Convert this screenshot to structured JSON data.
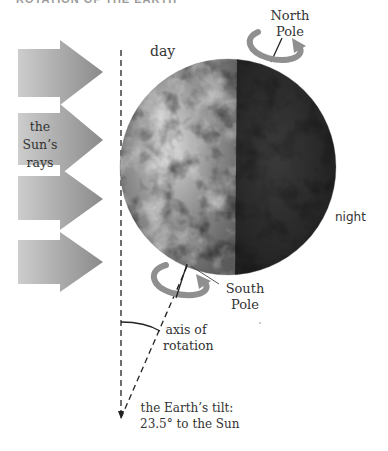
{
  "header": {
    "title": "ROTATION OF THE EARTH"
  },
  "labels": {
    "day": "day",
    "night": "night",
    "north_pole_line1": "North",
    "north_pole_line2": "Pole",
    "south_pole_line1": "South",
    "south_pole_line2": "Pole",
    "sun_rays_line1": "the Sun’s",
    "sun_rays_line2": "rays",
    "axis_line1": "axis of",
    "axis_line2": "rotation",
    "tilt_line1": "the Earth’s tilt:",
    "tilt_line2": "23.5° to the Sun"
  },
  "values": {
    "tilt_degrees": "23.5°",
    "sun_ray_arrow_count": 4
  },
  "colors": {
    "arrow_light": "#cbcbcb",
    "arrow_dark": "#8c8c8c",
    "rotation_arrow": "#8f8f8f",
    "earth_day": "#9a9a9a",
    "earth_night": "#2e2e2e",
    "line": "#222222"
  }
}
